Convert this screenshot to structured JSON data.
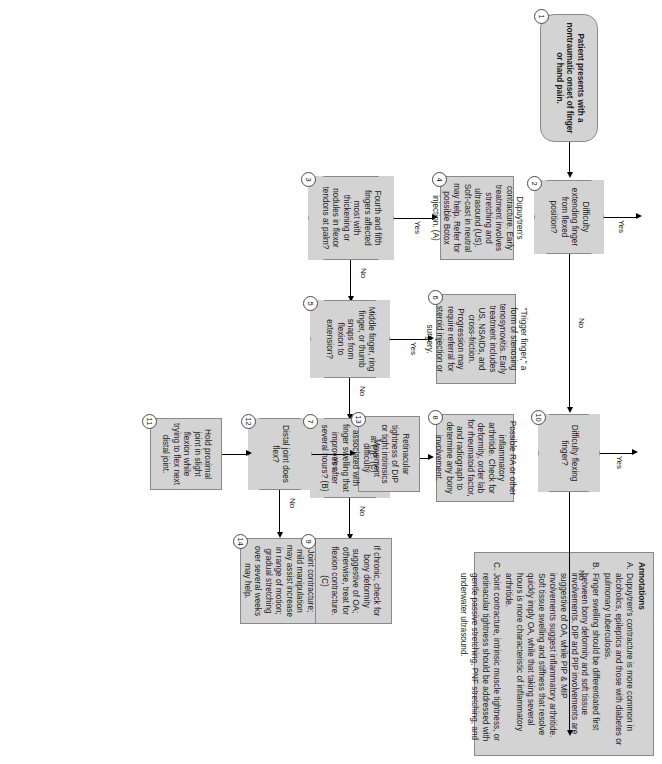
{
  "document": {
    "kind": "clinical-decision-flowchart",
    "orientation": "landscape-rotated-90"
  },
  "annotations": {
    "title": "Annotations",
    "items": [
      {
        "letter": "A.",
        "text": "Dupuytren's contracture is more common in alcoholics, epileptics and those with diabetes or pulmonary tuberculosis."
      },
      {
        "letter": "B.",
        "text": "Finger swelling should be differentiated first between bony deformity and soft tissue involvements. DIP and PIP involvements are suggestive of OA, while PIP & MIP involvements suggest inflammatory arthritide. Soft tissue swelling and stiffness that resolve quickly imply OA, while that taking several hours is more characteristic of inflammatory arthritide."
      },
      {
        "letter": "C.",
        "text": "Joint contracture, intrinsic muscle tightness, or retinacular tightness should be addressed with gentle passive stretching, PNF stretching, and underwater ultrasound."
      }
    ]
  },
  "nodes": [
    {
      "id": "1",
      "type": "terminator",
      "text": "Patient presents with a nontraumatic onset of finger or hand pain."
    },
    {
      "id": "2",
      "type": "decision",
      "text": "Difficulty extending finger from flexed position?"
    },
    {
      "id": "3",
      "type": "decision",
      "text": "Fourth and fifth fingers affected most with thickening or nodules in flexor tendons at palm?"
    },
    {
      "id": "4",
      "type": "process",
      "text": "Dupuytren's contracture. Early treatment involves stretching and ultrasound (US). Soft-cast in neutral may help. Refer for possible Botox injection. (A)"
    },
    {
      "id": "5",
      "type": "decision",
      "text": "Middle finger, ring finger, or thumb snaps from flexion to extension?"
    },
    {
      "id": "6",
      "type": "process",
      "text": "\"Trigger finger,\" a form of stenosing tenosynovitis. Early treatment includes US, NSAIDs, and cross-friction. Progression may require referral for steroid injection or surgery."
    },
    {
      "id": "7",
      "type": "decision",
      "text": "Movement difficulty associated with finger swelling that improves after several hours? (B)"
    },
    {
      "id": "8",
      "type": "process",
      "text": "Possible RA or other inflammatory arthritide. Check for deformity, order lab for rheumatoid factor, and radiograph to determine any bony involvement."
    },
    {
      "id": "9",
      "type": "process",
      "text": "If chronic, check for bony deformity suggestive of OA; otherwise, treat for flexion contracture. (C)"
    },
    {
      "id": "10",
      "type": "decision",
      "text": "Difficulty flexing finger?"
    },
    {
      "id": "11",
      "type": "process",
      "text": "Hold proximal joint in slight flexion while trying to flex next distal joint."
    },
    {
      "id": "12",
      "type": "decision",
      "text": "Distal joint does flex?"
    },
    {
      "id": "13",
      "type": "process",
      "text": "Retinacular tightness of DIP or tight intrinsics at PIP. (C)"
    },
    {
      "id": "14",
      "type": "process",
      "text": "Joint contracture; mild manipulation may assist increase in range of motion; gradual stretching over several weeks may help."
    }
  ],
  "edge_labels": {
    "e2_yes": "Yes",
    "e2_no": "No",
    "e3_yes": "Yes",
    "e3_no": "No",
    "e5_yes": "Yes",
    "e5_no": "No",
    "e7_yes": "Yes",
    "e7_no": "No",
    "e10_yes": "Yes",
    "e10_no": "No",
    "e12_yes": "Yes",
    "e12_no": "No"
  },
  "colors": {
    "node_fill": "#d3d3d3",
    "node_border": "#8a8a8a",
    "connector": "#000000",
    "page_background": "#ffffff"
  }
}
